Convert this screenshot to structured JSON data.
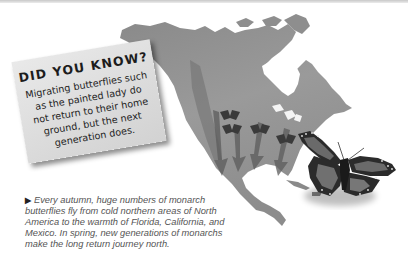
{
  "fact_box": {
    "title": "DID YOU KNOW?",
    "lines": [
      "Migrating butterflies such",
      "as the painted lady do",
      "not return to their home",
      "ground, but the next",
      "generation does."
    ]
  },
  "caption": {
    "bullet_icon": "▶",
    "lines": [
      "Every autumn, huge numbers of monarch",
      "butterflies fly from cold northern areas of North",
      "America to the warmth of Florida, California, and",
      "Mexico. In spring, new generations of monarchs",
      "make the long return journey north."
    ]
  },
  "map": {
    "region": "North America",
    "icons": [
      "small-butterfly-icon",
      "migration-arrow-icon",
      "monarch-butterfly-icon"
    ]
  },
  "colors": {
    "land": "#8f8f8f",
    "box_bg": "#dedede",
    "caption_text": "#555555",
    "title_text": "#1c1c1c"
  }
}
